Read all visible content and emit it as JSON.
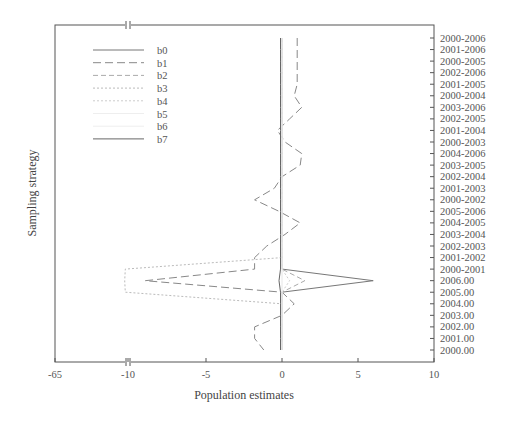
{
  "chart_data": {
    "type": "line",
    "title": "",
    "xlabel": "Population estimates",
    "ylabel": "Sampling strategy",
    "xlim": [
      -65,
      10
    ],
    "x_axis_break": {
      "from": -65,
      "to": -10
    },
    "x_ticks": [
      "-65",
      "-10",
      "-5",
      "0",
      "5",
      "10"
    ],
    "legend_position": "upper left",
    "grid": false,
    "categories": [
      "2000-2006",
      "2001-2006",
      "2000-2005",
      "2002-2006",
      "2001-2005",
      "2000-2004",
      "2003-2006",
      "2002-2005",
      "2001-2004",
      "2000-2003",
      "2004-2006",
      "2003-2005",
      "2002-2004",
      "2001-2003",
      "2000-2002",
      "2005-2006",
      "2004-2005",
      "2003-2004",
      "2002-2003",
      "2001-2002",
      "2000-2001",
      "2006.00",
      "2005.00",
      "2004.00",
      "2003.00",
      "2002.00",
      "2001.00",
      "2000.00"
    ],
    "series": [
      {
        "name": "b0",
        "style": "solid",
        "color": "#777777",
        "values": [
          0,
          0,
          0,
          0,
          0,
          0,
          0,
          0,
          0,
          0,
          0,
          0,
          0,
          0,
          0,
          0,
          0,
          0,
          0,
          0,
          0,
          6,
          0,
          0,
          0,
          0,
          0,
          0
        ]
      },
      {
        "name": "b1",
        "style": "long-dash",
        "color": "#888888",
        "values": [
          1,
          1,
          1,
          1,
          1,
          0.8,
          1.3,
          0.5,
          -0.3,
          0.2,
          1.3,
          1.2,
          0,
          -0.5,
          -1.8,
          -0.2,
          1.2,
          0.2,
          -1,
          -1.8,
          -1.8,
          -9,
          0,
          0.8,
          0,
          -1.8,
          -1.8,
          -1.2
        ]
      },
      {
        "name": "b2",
        "style": "dash",
        "color": "#aaaaaa",
        "values": [
          0,
          0,
          0,
          0,
          0,
          0,
          0,
          0,
          0,
          0,
          0,
          0,
          0,
          0,
          0,
          0,
          0,
          0,
          0,
          0,
          0,
          1.5,
          0,
          0,
          0,
          0,
          0,
          0
        ]
      },
      {
        "name": "b3",
        "style": "dotted",
        "color": "#bbbbbb",
        "values": [
          0,
          0,
          0,
          0,
          0,
          0,
          0,
          0,
          0,
          0,
          0,
          0,
          0,
          0,
          0,
          0,
          0,
          0,
          0,
          0,
          -12,
          -12.5,
          -12,
          0,
          0,
          0,
          0,
          0
        ]
      },
      {
        "name": "b4",
        "style": "dotted",
        "color": "#cccccc",
        "values": [
          0,
          0,
          0,
          0,
          0,
          0,
          0,
          0,
          0,
          0,
          0,
          0,
          0,
          0,
          0,
          0,
          0,
          0,
          0,
          0,
          0,
          0.5,
          0,
          0,
          0,
          0,
          0,
          0
        ]
      },
      {
        "name": "b5",
        "style": "solid",
        "color": "#eeeeee",
        "values": [
          0,
          0,
          0,
          0,
          0,
          0,
          0,
          0,
          0,
          0,
          0,
          0,
          0,
          0,
          0,
          0,
          0,
          0,
          0,
          0,
          0,
          0,
          0,
          0,
          0,
          0,
          0,
          0
        ]
      },
      {
        "name": "b6",
        "style": "solid",
        "color": "#eeeeee",
        "values": [
          0,
          0,
          0,
          0,
          0,
          0,
          0,
          0,
          0,
          0,
          0,
          0,
          0,
          0,
          0,
          0,
          0,
          0,
          0,
          0,
          0,
          0,
          0,
          0,
          0,
          0,
          0,
          0
        ]
      },
      {
        "name": "b7",
        "style": "solid",
        "color": "#666666",
        "values": [
          -0.1,
          -0.1,
          -0.1,
          -0.1,
          -0.1,
          -0.1,
          -0.1,
          -0.1,
          -0.1,
          -0.1,
          -0.1,
          -0.1,
          -0.1,
          -0.1,
          -0.1,
          -0.1,
          -0.1,
          -0.1,
          -0.1,
          -0.1,
          -0.1,
          -0.2,
          -0.1,
          -0.1,
          -0.1,
          -0.1,
          -0.1,
          -0.1
        ]
      }
    ]
  }
}
